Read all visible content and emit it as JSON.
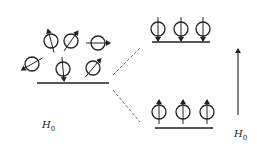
{
  "diagram": {
    "type": "spin-alignment",
    "colors": {
      "stroke": "#222222",
      "dashed": "#555555",
      "background": "#ffffff"
    },
    "left_group": {
      "label": "H",
      "label_sub": "0",
      "baseline": {
        "x1": 37,
        "x2": 109,
        "y": 83
      },
      "spins": [
        {
          "cx": 51,
          "cy": 41,
          "r": 7,
          "angle": -15
        },
        {
          "cx": 71,
          "cy": 41,
          "r": 7,
          "angle": 35
        },
        {
          "cx": 98,
          "cy": 43,
          "r": 7,
          "angle": 90
        },
        {
          "cx": 32,
          "cy": 64,
          "r": 7,
          "angle": -120
        },
        {
          "cx": 63,
          "cy": 69,
          "r": 7,
          "angle": 175
        },
        {
          "cx": 93,
          "cy": 68,
          "r": 7,
          "angle": 40
        }
      ]
    },
    "upper_level": {
      "baseline": {
        "x1": 152,
        "x2": 210,
        "y": 42
      },
      "spin_direction": "down",
      "spins": [
        {
          "cx": 158,
          "cy": 29,
          "r": 7
        },
        {
          "cx": 181,
          "cy": 29,
          "r": 7
        },
        {
          "cx": 203,
          "cy": 29,
          "r": 7
        }
      ]
    },
    "lower_level": {
      "baseline": {
        "x1": 155,
        "x2": 213,
        "y": 128
      },
      "spin_direction": "up",
      "spins": [
        {
          "cx": 159,
          "cy": 112,
          "r": 7
        },
        {
          "cx": 183,
          "cy": 112,
          "r": 7
        },
        {
          "cx": 207,
          "cy": 112,
          "r": 7
        }
      ]
    },
    "splitting_lines": [
      {
        "x1": 113,
        "y1": 75,
        "x2": 140,
        "y2": 48
      },
      {
        "x1": 113,
        "y1": 90,
        "x2": 140,
        "y2": 122
      }
    ],
    "field_arrow": {
      "x": 238,
      "y_tail": 115,
      "y_head": 45,
      "label": "H",
      "label_sub": "0"
    }
  }
}
